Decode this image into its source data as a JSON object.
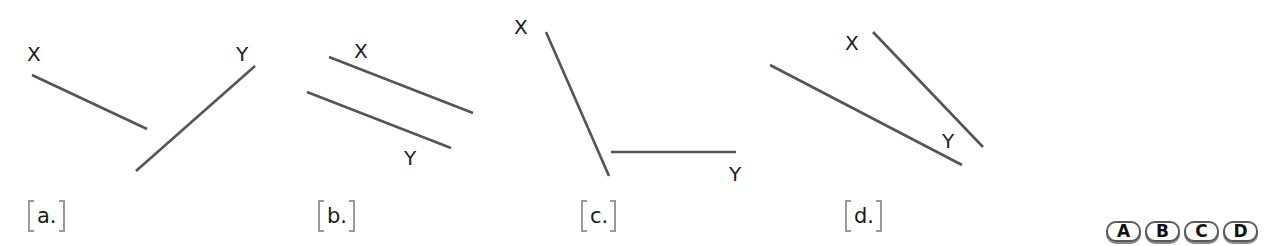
{
  "figures": [
    {
      "id": "a",
      "option_label": "a.",
      "segments": [
        {
          "name": "X",
          "x1": 32,
          "y1": 75,
          "x2": 147,
          "y2": 129
        },
        {
          "name": "Y",
          "x1": 255,
          "y1": 66,
          "x2": 136,
          "y2": 171
        }
      ],
      "point_labels": [
        {
          "text": "X",
          "x": 27,
          "y": 61
        },
        {
          "text": "Y",
          "x": 236,
          "y": 61
        }
      ],
      "relationship": "intersecting (when extended)"
    },
    {
      "id": "b",
      "option_label": "b.",
      "segments": [
        {
          "name": "X",
          "x1": 329,
          "y1": 57,
          "x2": 473,
          "y2": 113
        },
        {
          "name": "Y",
          "x1": 307,
          "y1": 92,
          "x2": 451,
          "y2": 148
        }
      ],
      "point_labels": [
        {
          "text": "X",
          "x": 354,
          "y": 58
        },
        {
          "text": "Y",
          "x": 404,
          "y": 165
        }
      ],
      "relationship": "parallel"
    },
    {
      "id": "c",
      "option_label": "c.",
      "segments": [
        {
          "name": "X",
          "x1": 546,
          "y1": 32,
          "x2": 609,
          "y2": 176
        },
        {
          "name": "Y",
          "x1": 611,
          "y1": 152,
          "x2": 736,
          "y2": 152
        }
      ],
      "point_labels": [
        {
          "text": "X",
          "x": 514,
          "y": 34
        },
        {
          "text": "Y",
          "x": 729,
          "y": 181
        }
      ],
      "relationship": "intersecting (when extended)"
    },
    {
      "id": "d",
      "option_label": "d.",
      "segments": [
        {
          "name": "X",
          "x1": 873,
          "y1": 32,
          "x2": 983,
          "y2": 147
        },
        {
          "name": "Y",
          "x1": 770,
          "y1": 65,
          "x2": 962,
          "y2": 165
        }
      ],
      "point_labels": [
        {
          "text": "X",
          "x": 845,
          "y": 50
        },
        {
          "text": "Y",
          "x": 942,
          "y": 148
        }
      ],
      "relationship": "intersecting (when extended)"
    }
  ],
  "option_label_positions": [
    28,
    318,
    581,
    845
  ],
  "answer_choices": [
    "A",
    "B",
    "C",
    "D"
  ],
  "colors": {
    "line": "#555555",
    "text": "#1a1a1a",
    "bracket": "#9a9a9a",
    "bubble_border": "#5a5a5a",
    "bubble_shadow": "#8a8a8a"
  }
}
